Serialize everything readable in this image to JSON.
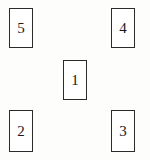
{
  "diagram": {
    "background_color": "#fdfdfb",
    "box_fill_color": "#ffffff",
    "box_border_color": "#2b2b2b",
    "text_color": "#1a1a1a",
    "boxes": [
      {
        "id": "box-5",
        "label": "5",
        "position": "top-left"
      },
      {
        "id": "box-4",
        "label": "4",
        "position": "top-right"
      },
      {
        "id": "box-1",
        "label": "1",
        "position": "center"
      },
      {
        "id": "box-2",
        "label": "2",
        "position": "bottom-left"
      },
      {
        "id": "box-3",
        "label": "3",
        "position": "bottom-right"
      }
    ]
  },
  "chart_data": {
    "type": "scatter",
    "xlabel": "",
    "ylabel": "",
    "xlim": [
      0,
      150
    ],
    "ylim": [
      0,
      160
    ],
    "grid": false,
    "legend": "none",
    "labels": [
      "5",
      "4",
      "1",
      "2",
      "3"
    ],
    "x": [
      21,
      123,
      75,
      21,
      123
    ],
    "y": [
      28,
      28,
      80,
      131,
      131
    ],
    "annotations": [
      "5 at top-left",
      "4 at top-right",
      "1 at center",
      "2 at bottom-left",
      "3 at bottom-right"
    ]
  }
}
